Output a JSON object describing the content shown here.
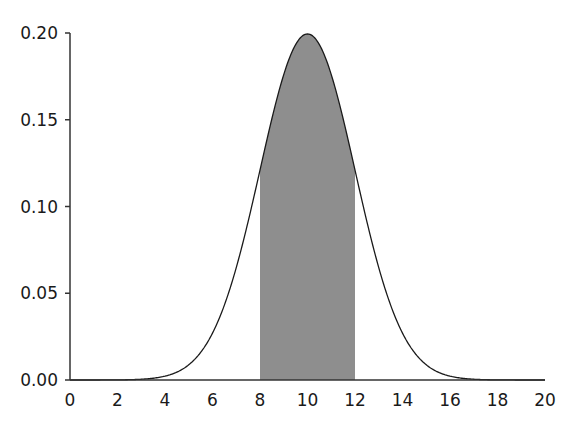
{
  "chart_data": {
    "type": "area",
    "title": "",
    "xlabel": "",
    "ylabel": "",
    "distribution": {
      "name": "normal",
      "mean": 10,
      "sd": 2
    },
    "xlim": [
      0,
      20
    ],
    "ylim": [
      0,
      0.2
    ],
    "x_ticks": [
      0,
      2,
      4,
      6,
      8,
      10,
      12,
      14,
      16,
      18,
      20
    ],
    "x_tick_labels": [
      "0",
      "2",
      "4",
      "6",
      "8",
      "10",
      "12",
      "14",
      "16",
      "18",
      "20"
    ],
    "y_ticks": [
      0.0,
      0.05,
      0.1,
      0.15,
      0.2
    ],
    "y_tick_labels": [
      "0.00",
      "0.05",
      "0.10",
      "0.15",
      "0.20"
    ],
    "shaded_region": {
      "from": 8,
      "to": 12,
      "color": "#8e8e8e"
    },
    "series": [
      {
        "name": "density",
        "x": [
          0,
          2,
          4,
          5,
          6,
          7,
          8,
          9,
          10,
          11,
          12,
          13,
          14,
          15,
          16,
          18,
          20
        ],
        "values": [
          0.0,
          0.0001,
          0.0022,
          0.0088,
          0.027,
          0.0648,
          0.121,
          0.176,
          0.1995,
          0.176,
          0.121,
          0.0648,
          0.027,
          0.0088,
          0.0022,
          0.0001,
          0.0
        ]
      }
    ],
    "grid": false,
    "legend": null,
    "colors": {
      "curve": "#1a1a1a",
      "shade": "#8e8e8e",
      "axis": "#333333"
    }
  }
}
